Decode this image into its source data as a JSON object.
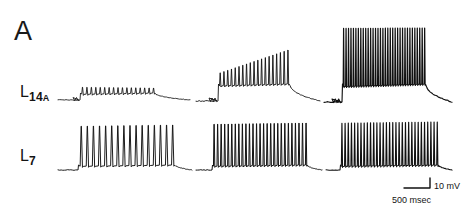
{
  "figure": {
    "panel_label": "A",
    "background_color": "#ffffff",
    "trace_color": "#111111",
    "width": 467,
    "height": 218
  },
  "rows": [
    {
      "id": "l14a",
      "label_main": "L",
      "label_sub": "14",
      "label_sub2": "A",
      "label_full": "L14A",
      "description": "upper intracellular recording row"
    },
    {
      "id": "l7",
      "label_main": "L",
      "label_sub": "7",
      "label_sub2": "",
      "label_full": "L7",
      "description": "lower intracellular recording row"
    }
  ],
  "scale_bar": {
    "vertical_label": "10 mV",
    "horizontal_label": "500 msec",
    "vertical_value": 10,
    "vertical_unit": "mV",
    "horizontal_value": 500,
    "horizontal_unit": "msec"
  },
  "chart_data": {
    "type": "line",
    "title": "A",
    "xlabel": "",
    "ylabel": "",
    "grid": false,
    "legend": "none",
    "scale_vertical": "10 mV",
    "scale_horizontal": "500 msec",
    "series": [
      {
        "name": "L14A trial 1",
        "row": "L14A",
        "column": 1,
        "spike_count": 17,
        "spike_amplitude_mV": 6,
        "burst_duration_msec": 1200,
        "pattern": "low-amplitude decrementing oscillation on depolarizing plateau"
      },
      {
        "name": "L14A trial 2",
        "row": "L14A",
        "column": 2,
        "spike_count": 19,
        "spike_amplitude_mV": 14,
        "burst_duration_msec": 1300,
        "pattern": "plateau with growing spike amplitude, large spikes late in burst"
      },
      {
        "name": "L14A trial 3",
        "row": "L14A",
        "column": 3,
        "spike_count": 34,
        "spike_amplitude_mV": 30,
        "burst_duration_msec": 1300,
        "pattern": "dense high-frequency full-amplitude burst"
      },
      {
        "name": "L7 trial 1",
        "row": "L7",
        "column": 1,
        "spike_count": 16,
        "spike_amplitude_mV": 22,
        "burst_duration_msec": 1400,
        "pattern": "regular tall action potentials, moderate frequency"
      },
      {
        "name": "L7 trial 2",
        "row": "L7",
        "column": 2,
        "spike_count": 27,
        "spike_amplitude_mV": 22,
        "burst_duration_msec": 1400,
        "pattern": "higher frequency spike train with flanking single spikes"
      },
      {
        "name": "L7 trial 3",
        "row": "L7",
        "column": 3,
        "spike_count": 31,
        "spike_amplitude_mV": 22,
        "burst_duration_msec": 1400,
        "pattern": "densest spike train, sustained high frequency"
      }
    ]
  }
}
